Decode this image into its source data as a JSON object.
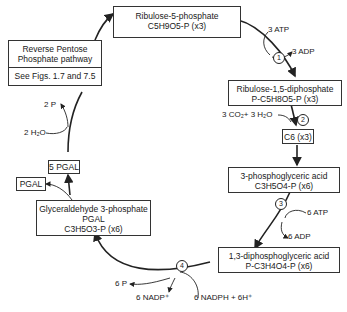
{
  "diagram": {
    "type": "Calvin cycle (reductive pentose phosphate pathway)",
    "nodes": {
      "ribulose5p": {
        "line1": "Ribulose-5-phosphate",
        "line2": "C5H9O5-P (x3)"
      },
      "rubp": {
        "line1": "Ribulose-1,5-diphosphate",
        "line2": "P-C5H8O5-P (x3)"
      },
      "c6": {
        "line1": "C6 (x3)"
      },
      "pga": {
        "line1": "3-phosphoglyceric acid",
        "line2": "C3H5O4-P (x6)"
      },
      "dpga": {
        "line1": "1,3-diphosphoglyceric acid",
        "line2": "P-C3H4O4-P (x6)"
      },
      "g3p": {
        "line1": "Glyceraldehyde 3-phosphate",
        "line2": "PGAL",
        "line3": "C3H5O3-P (x6)"
      },
      "pgal": {
        "line1": "PGAL"
      },
      "pgal5": {
        "line1": "5 PGAL"
      },
      "reverse": {
        "line1": "Reverse Pentose",
        "line2": "Phosphate pathway",
        "line3": "See Figs. 1.7 and 7.5"
      }
    },
    "labels": {
      "atp3": "3 ATP",
      "adp3": "3 ADP",
      "co2": "3 CO₂+ 3 H₂O",
      "atp6": "6 ATP",
      "adp6": "6 ADP",
      "p6": "6 P",
      "nadp": "6 NADP⁺",
      "nadph": "6 NADPH + 6H⁺",
      "p2": "2 P",
      "h2o2": "2 H₂O"
    },
    "steps": [
      "1",
      "2",
      "3",
      "4"
    ]
  }
}
